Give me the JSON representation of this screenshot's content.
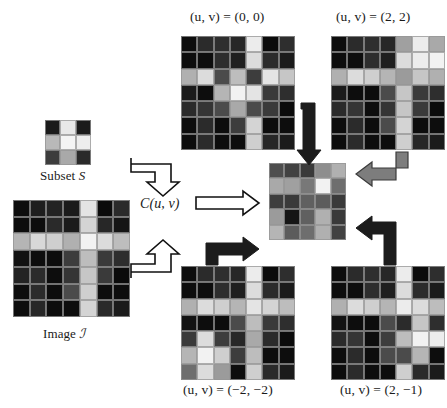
{
  "figure": {
    "title_alt": "Cross-correlation of subset S with image I at several shifts",
    "background": "#ffffff",
    "palette": {
      "black": "#0b0b0b",
      "near_black": "#141414",
      "dark": "#242424",
      "dark2": "#2e2e2e",
      "mid_dark": "#3c3c3c",
      "mid": "#4e4e4e",
      "mid2": "#5c5c5c",
      "gray": "#6e6e6e",
      "light_gray": "#9b9b9b",
      "lighter": "#bdbdbd",
      "very_light": "#d9d9d9",
      "white": "#f3f3f3",
      "arrow_outline": "#111111",
      "arrow_white_fill": "#ffffff",
      "arrow_gray_fill": "#808080",
      "grid_line": "#969696"
    }
  },
  "labels": {
    "subset": "Subset",
    "subset_symbol": "S",
    "image": "Image",
    "image_symbol": "ℐ",
    "correlation": "C(u, v)",
    "top_left": "(u, v) = (0, 0)",
    "top_right": "(u, v) = (2, 2)",
    "bottom_left": "(u, v) = (−2, −2)",
    "bottom_right": "(u, v) = (2, −1)"
  },
  "grids": {
    "subset": {
      "name": "subset-grid",
      "rows": 3,
      "cols": 3,
      "cells": [
        [
          "#1b1b1b",
          "#e8e8e8",
          "#1b1b1b"
        ],
        [
          "#b9b9b9",
          "#f4f4f4",
          "#ededed"
        ],
        [
          "#3d3d3d",
          "#a9a9a9",
          "#2a2a2a"
        ]
      ]
    },
    "image": {
      "name": "image-grid",
      "rows": 7,
      "cols": 7,
      "cells": [
        [
          "#0d0d0d",
          "#1e1e1e",
          "#232323",
          "#1b1b1b",
          "#e4e4e4",
          "#0b0b0b",
          "#2a2a2a"
        ],
        [
          "#0d0d0d",
          "#0d0d0d",
          "#2a2a2a",
          "#1b1b1b",
          "#d4d4d4",
          "#272727",
          "#151515"
        ],
        [
          "#b5b5b5",
          "#d8d8d8",
          "#cfcfcf",
          "#b0b0b0",
          "#f2f2f2",
          "#dcdcdc",
          "#bdbdbd"
        ],
        [
          "#121212",
          "#0d0d0d",
          "#0d0d0d",
          "#3d3d3d",
          "#bdbdbd",
          "#3a3a3a",
          "#2e2e2e"
        ],
        [
          "#232323",
          "#2b2b2b",
          "#0d0d0d",
          "#353535",
          "#c6c6c6",
          "#3a3a3a",
          "#0b0b0b"
        ],
        [
          "#0d0d0d",
          "#2b2b2b",
          "#0d0d0d",
          "#4b4b4b",
          "#cfcfcf",
          "#0d0d0d",
          "#0d0d0d"
        ],
        [
          "#0d0d0d",
          "#272727",
          "#0d0d0d",
          "#0d0d0d",
          "#d4d4d4",
          "#2a2a2a",
          "#1b1b1b"
        ]
      ]
    },
    "shift_00": {
      "name": "shift-grid-0-0",
      "rows": 7,
      "cols": 7,
      "cells": [
        [
          "#0d0d0d",
          "#2b2b2b",
          "#2e2e2e",
          "#272727",
          "#ececec",
          "#0b0b0b",
          "#2e2e2e"
        ],
        [
          "#0d0d0d",
          "#0d0d0d",
          "#2e2e2e",
          "#1f1f1f",
          "#dcdcdc",
          "#2b2b2b",
          "#1b1b1b"
        ],
        [
          "#b0b0b0",
          "#dcdcdc",
          "#4b4b4b",
          "#bdbdbd",
          "#3d3d3d",
          "#e4e4e4",
          "#c6c6c6"
        ],
        [
          "#1b1b1b",
          "#0d0d0d",
          "#b5b5b5",
          "#f2f2f2",
          "#e4e4e4",
          "#3a3a3a",
          "#2e2e2e"
        ],
        [
          "#2b2b2b",
          "#353535",
          "#4b4b4b",
          "#a9a9a9",
          "#4b4b4b",
          "#3a3a3a",
          "#0b0b0b"
        ],
        [
          "#0d0d0d",
          "#2b2b2b",
          "#0d0d0d",
          "#3d3d3d",
          "#d4d4d4",
          "#0d0d0d",
          "#0d0d0d"
        ],
        [
          "#0d0d0d",
          "#2b2b2b",
          "#0d0d0d",
          "#0d0d0d",
          "#cfcfcf",
          "#272727",
          "#1b1b1b"
        ]
      ]
    },
    "shift_22": {
      "name": "shift-grid-2-2",
      "rows": 7,
      "cols": 7,
      "cells": [
        [
          "#0d0d0d",
          "#2b2b2b",
          "#2e2e2e",
          "#272727",
          "#a0a0a0",
          "#ececec",
          "#a9a9a9"
        ],
        [
          "#0d0d0d",
          "#0d0d0d",
          "#2e2e2e",
          "#1f1f1f",
          "#dcdcdc",
          "#ededed",
          "#f2f2f2"
        ],
        [
          "#b0b0b0",
          "#dcdcdc",
          "#cfcfcf",
          "#b5b5b5",
          "#9b9b9b",
          "#c6c6c6",
          "#b0b0b0"
        ],
        [
          "#1b1b1b",
          "#0d0d0d",
          "#0d0d0d",
          "#4b4b4b",
          "#c6c6c6",
          "#3a3a3a",
          "#2e2e2e"
        ],
        [
          "#2b2b2b",
          "#353535",
          "#0d0d0d",
          "#353535",
          "#c6c6c6",
          "#3a3a3a",
          "#0b0b0b"
        ],
        [
          "#0d0d0d",
          "#2b2b2b",
          "#0d0d0d",
          "#4b4b4b",
          "#d4d4d4",
          "#0d0d0d",
          "#0d0d0d"
        ],
        [
          "#0d0d0d",
          "#2b2b2b",
          "#0d0d0d",
          "#0d0d0d",
          "#cfcfcf",
          "#272727",
          "#1b1b1b"
        ]
      ]
    },
    "shift_m2m2": {
      "name": "shift-grid-m2-m2",
      "rows": 7,
      "cols": 7,
      "cells": [
        [
          "#0d0d0d",
          "#2b2b2b",
          "#2e2e2e",
          "#272727",
          "#ececec",
          "#0b0b0b",
          "#2e2e2e"
        ],
        [
          "#0d0d0d",
          "#0d0d0d",
          "#2e2e2e",
          "#1f1f1f",
          "#dcdcdc",
          "#2b2b2b",
          "#1b1b1b"
        ],
        [
          "#b0b0b0",
          "#dcdcdc",
          "#cfcfcf",
          "#b5b5b5",
          "#e4e4e4",
          "#d4d4d4",
          "#bdbdbd"
        ],
        [
          "#121212",
          "#0d0d0d",
          "#0d0d0d",
          "#4b4b4b",
          "#bdbdbd",
          "#3a3a3a",
          "#2e2e2e"
        ],
        [
          "#3a3a3a",
          "#dcdcdc",
          "#3d3d3d",
          "#272727",
          "#a9a9a9",
          "#2b2b2b",
          "#0b0b0b"
        ],
        [
          "#b5b5b5",
          "#f2f2f2",
          "#cfcfcf",
          "#3d3d3d",
          "#bdbdbd",
          "#0d0d0d",
          "#0d0d0d"
        ],
        [
          "#6e6e6e",
          "#dcdcdc",
          "#9b9b9b",
          "#0d0d0d",
          "#cfcfcf",
          "#2a2a2a",
          "#1b1b1b"
        ]
      ]
    },
    "shift_2m1": {
      "name": "shift-grid-2-m1",
      "rows": 7,
      "cols": 7,
      "cells": [
        [
          "#0d0d0d",
          "#2b2b2b",
          "#2e2e2e",
          "#272727",
          "#ececec",
          "#0b0b0b",
          "#2e2e2e"
        ],
        [
          "#0d0d0d",
          "#0d0d0d",
          "#2e2e2e",
          "#1f1f1f",
          "#dcdcdc",
          "#2b2b2b",
          "#1b1b1b"
        ],
        [
          "#b0b0b0",
          "#dcdcdc",
          "#cfcfcf",
          "#b5b5b5",
          "#ececec",
          "#dcdcdc",
          "#bdbdbd"
        ],
        [
          "#121212",
          "#0d0d0d",
          "#0d0d0d",
          "#4b4b4b",
          "#2b2b2b",
          "#c6c6c6",
          "#2e2e2e"
        ],
        [
          "#2b2b2b",
          "#353535",
          "#0d0d0d",
          "#3d3d3d",
          "#bdbdbd",
          "#f2f2f2",
          "#ededed"
        ],
        [
          "#0d0d0d",
          "#2b2b2b",
          "#0d0d0d",
          "#4b4b4b",
          "#4b4b4b",
          "#b5b5b5",
          "#0d0d0d"
        ],
        [
          "#0d0d0d",
          "#2b2b2b",
          "#0d0d0d",
          "#0d0d0d",
          "#cfcfcf",
          "#2a2a2a",
          "#1b1b1b"
        ]
      ]
    },
    "correlation": {
      "name": "correlation-grid",
      "rows": 5,
      "cols": 5,
      "cells": [
        [
          "#4e4e4e",
          "#424242",
          "#3a3a3a",
          "#8e8e8e",
          "#b0b0b0"
        ],
        [
          "#a9a9a9",
          "#a0a0a0",
          "#787878",
          "#f2f2f2",
          "#6e6e6e"
        ],
        [
          "#3d3d3d",
          "#3a3a3a",
          "#606060",
          "#5c5c5c",
          "#3a3a3a"
        ],
        [
          "#9b9b9b",
          "#151515",
          "#606060",
          "#b0b0b0",
          "#3a3a3a"
        ],
        [
          "#b5b5b5",
          "#5c5c5c",
          "#6e6e6e",
          "#b0b0b0",
          "#424242"
        ]
      ]
    }
  },
  "arrows": [
    {
      "name": "arrow-subset-to-correlation",
      "style": "outline-white",
      "direction": "down",
      "description": "hooked arrow from subset down to C(u,v)"
    },
    {
      "name": "arrow-image-to-correlation",
      "style": "outline-white",
      "direction": "up",
      "description": "hooked arrow from image up to C(u,v)"
    },
    {
      "name": "arrow-correlation-to-result",
      "style": "outline-white",
      "direction": "right",
      "description": "straight arrow from C(u,v) into the result map"
    },
    {
      "name": "arrow-top-left-to-result",
      "style": "solid-black",
      "direction": "down",
      "description": "arrow from (0,0) grid down into result"
    },
    {
      "name": "arrow-top-right-to-result",
      "style": "solid-gray",
      "direction": "left",
      "description": "arrow from (2,2) grid left into result"
    },
    {
      "name": "arrow-bottom-left-to-result",
      "style": "solid-black",
      "direction": "right",
      "description": "arrow from (-2,-2) grid right into result"
    },
    {
      "name": "arrow-bottom-right-to-result",
      "style": "solid-black",
      "direction": "left",
      "description": "arrow from (2,-1) grid left into result"
    }
  ]
}
